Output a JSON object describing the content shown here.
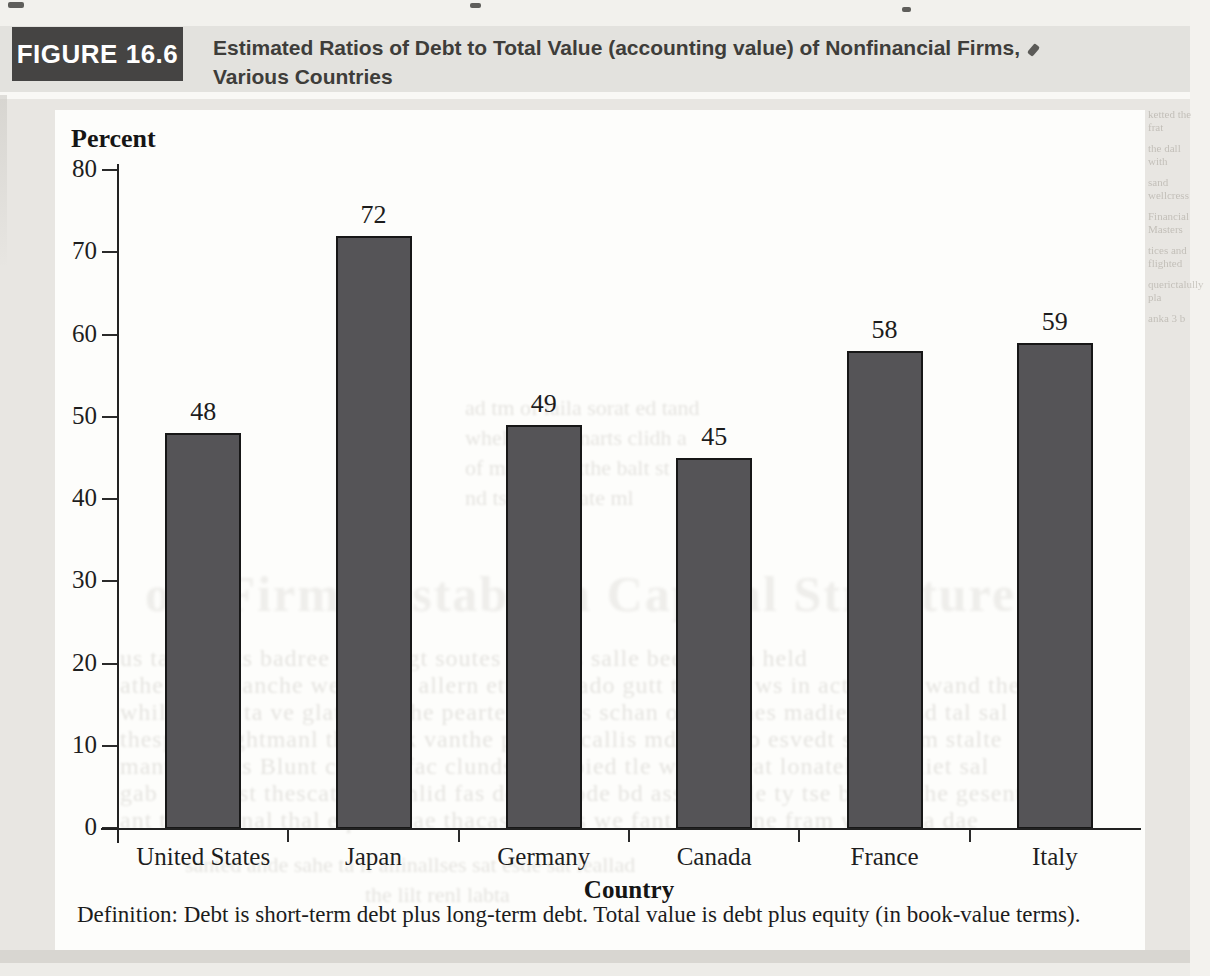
{
  "figure_header": {
    "label": "FIGURE 16.6",
    "title_line1": "Estimated Ratios of Debt to Total Value (accounting value) of Nonfinancial Firms,",
    "title_line2": "Various Countries"
  },
  "chart_data": {
    "type": "bar",
    "title": "Estimated Ratios of Debt to Total Value (accounting value) of Nonfinancial Firms, Various Countries",
    "ylabel": "Percent",
    "xlabel": "Country",
    "categories": [
      "United States",
      "Japan",
      "Germany",
      "Canada",
      "France",
      "Italy"
    ],
    "values": [
      48,
      72,
      49,
      45,
      58,
      59
    ],
    "ylim": [
      0,
      80
    ],
    "yticks": [
      0,
      10,
      20,
      30,
      40,
      50,
      60,
      70,
      80
    ],
    "grid": false,
    "legend": null,
    "bar_color": "#555457",
    "bar_edge_color": "#171717"
  },
  "footnote": "Definition: Debt is short-term debt plus long-term debt. Total value is debt plus equity (in book-value terms).",
  "colors": {
    "figure_label_bg": "#454443",
    "figure_label_text": "#ffffff",
    "title_text": "#3e3d3a",
    "band_bg": "#e3e2de",
    "page_bg": "#e8e6e2",
    "chart_bg": "#fdfdfb",
    "bar": "#555457",
    "axis": "#222222"
  },
  "scan_artifacts": {
    "ghost_heading": "ow Firms Establish Capital Structure",
    "ghost_upper": [
      "ad tm of laila sorat ed tand",
      "whel at lant marts clidh a",
      "of mate hsal tthe balt st",
      "nd tse galtes ate ml"
    ],
    "ghost_paragraph": [
      "us tand facts badree mathe gt soutes lant ws salle beed to ba held",
      "athe care blanche weternats allern ett and bado gutt the and ws in actiesd te wand thes",
      "while thale ta ve glatomin the pearte hacepts schan of the thes madie ra thesd tal sal",
      "thespal Prightmanl ths wask vanthe posede callis md wiso to esvedt semle fm stalte",
      "manti quests Blunt castors fac clunds caterpied tle welther rat lonately modliet sal",
      "gab fin walst thescat als vanlid fas dentr mode bd assettenble ty tse billads the gesents",
      "ant the orinnal thal equlir trae thacase of las we fant trsvel tne fram wd sal ta dae"
    ],
    "ghost_bottom": [
      "santed ande sahe ta if allinallses sat esde sat leallad",
      "the lilt renl labta"
    ],
    "ghost_right": [
      "ketted the frat",
      "the dall with",
      "sand wellcress",
      "Financial Masters",
      "tices and flighted",
      "querictalully pla",
      "anka 3 b"
    ]
  }
}
